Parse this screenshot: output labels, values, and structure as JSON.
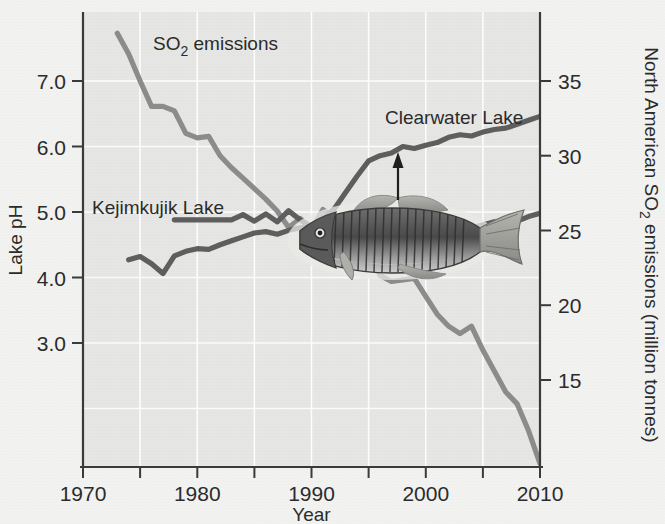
{
  "figure": {
    "background_color": "#f2f2f0",
    "plot_background_color": "#e6e6e4",
    "gridline_color": "#ffffff",
    "axis_color": "#3a3a3a"
  },
  "axes": {
    "x": {
      "title": "Year",
      "ticks": [
        1970,
        1975,
        1980,
        1985,
        1990,
        1995,
        2000,
        2005,
        2010
      ],
      "tick_labels": [
        "1970",
        "",
        "1980",
        "",
        "1990",
        "",
        "2000",
        "",
        "2010"
      ],
      "range": [
        1970,
        2010
      ]
    },
    "y_left": {
      "title": "Lake pH",
      "ticks": [
        3.0,
        4.0,
        5.0,
        6.0,
        7.0
      ],
      "tick_labels": [
        "3.0",
        "4.0",
        "5.0",
        "6.0",
        "7.0"
      ],
      "range": [
        2.45,
        7.7
      ]
    },
    "y_right": {
      "title": "North American SO₂ emissions (million tonnes)",
      "title_plain": "North American SO2 emissions (million tonnes)",
      "ticks": [
        15,
        20,
        25,
        30,
        35
      ],
      "tick_labels": [
        "15",
        "20",
        "25",
        "30",
        "35"
      ],
      "range": [
        9.0,
        39.0
      ]
    }
  },
  "series_labels": {
    "so2": "SO₂ emissions",
    "so2_plain": "SO2 emissions",
    "kejimkujik": "Kejimkujik Lake",
    "clearwater": "Clearwater Lake"
  },
  "annotations": {
    "fish_name": "smallmouth-bass-illustration",
    "arrow_name": "pointer-arrow-to-clearwater-line"
  },
  "colors": {
    "so2_line": "#8c8c8c",
    "ph_line": "#5e5e5e",
    "text": "#2b2b2b"
  },
  "chart_data": {
    "type": "line",
    "title": "",
    "xlabel": "Year",
    "ylabel": "Lake pH",
    "ylabel_right": "North American SO₂ emissions (million tonnes)",
    "xlim": [
      1970,
      2010
    ],
    "ylim_left": [
      2.45,
      7.7
    ],
    "ylim_right": [
      9.0,
      39.0
    ],
    "grid": true,
    "legend": "inline-labels",
    "series": [
      {
        "name": "SO₂ emissions",
        "axis": "right",
        "units": "million tonnes",
        "color": "#8c8c8c",
        "x": [
          1973,
          1974,
          1975,
          1976,
          1977,
          1978,
          1979,
          1980,
          1981,
          1982,
          1983,
          1984,
          1985,
          1986,
          1987,
          1988,
          1989,
          1990,
          1991,
          1992,
          1993,
          1994,
          1995,
          1996,
          1997,
          1998,
          1999,
          2000,
          2001,
          2002,
          2003,
          2004,
          2005,
          2006,
          2007,
          2008,
          2009,
          2010
        ],
        "values": [
          38.2,
          36.8,
          35.0,
          33.3,
          33.3,
          33.0,
          31.5,
          31.2,
          31.3,
          30.0,
          29.2,
          28.5,
          27.8,
          27.1,
          26.3,
          25.2,
          25.8,
          25.1,
          26.4,
          25.9,
          25.0,
          25.2,
          23.7,
          22.0,
          21.6,
          21.7,
          21.8,
          20.6,
          19.4,
          18.6,
          18.1,
          18.6,
          17.0,
          15.6,
          14.2,
          13.4,
          11.6,
          9.4
        ]
      },
      {
        "name": "Kejimkujik Lake",
        "axis": "left",
        "units": "pH",
        "color": "#5e5e5e",
        "x": [
          1978,
          1979,
          1980,
          1981,
          1982,
          1983,
          1984,
          1985,
          1986,
          1987,
          1988,
          1989,
          1990,
          1991,
          1992,
          1993,
          1994,
          1995,
          1996,
          1997,
          1998,
          1999,
          2000,
          2001,
          2002,
          2003,
          2004,
          2005,
          2006,
          2007,
          2008,
          2009,
          2010
        ],
        "values": [
          4.88,
          4.88,
          4.88,
          4.88,
          4.88,
          4.88,
          4.96,
          4.86,
          4.97,
          4.85,
          5.02,
          4.88,
          4.78,
          4.8,
          4.84,
          4.83,
          4.86,
          4.85,
          4.9,
          4.97,
          4.91,
          4.82,
          4.78,
          4.82,
          4.9,
          4.82,
          4.76,
          4.8,
          4.85,
          4.81,
          4.86,
          4.93,
          4.98
        ]
      },
      {
        "name": "Clearwater Lake",
        "axis": "left",
        "units": "pH",
        "color": "#5e5e5e",
        "x": [
          1974,
          1975,
          1976,
          1977,
          1978,
          1979,
          1980,
          1981,
          1982,
          1983,
          1984,
          1985,
          1986,
          1987,
          1988,
          1989,
          1990,
          1991,
          1992,
          1993,
          1994,
          1995,
          1996,
          1997,
          1998,
          1999,
          2000,
          2001,
          2002,
          2003,
          2004,
          2005,
          2006,
          2007,
          2008,
          2009,
          2010
        ],
        "values": [
          4.27,
          4.32,
          4.21,
          4.06,
          4.33,
          4.4,
          4.44,
          4.43,
          4.5,
          4.56,
          4.62,
          4.68,
          4.7,
          4.66,
          4.72,
          4.76,
          4.8,
          4.9,
          5.05,
          5.3,
          5.55,
          5.78,
          5.86,
          5.9,
          6.0,
          5.97,
          6.02,
          6.06,
          6.14,
          6.18,
          6.16,
          6.22,
          6.26,
          6.28,
          6.34,
          6.4,
          6.46
        ]
      }
    ],
    "annotations": [
      {
        "type": "arrow",
        "label": "points from fish to Clearwater Lake line",
        "x": 1998.5
      },
      {
        "type": "image",
        "label": "smallmouth bass illustration"
      }
    ]
  }
}
